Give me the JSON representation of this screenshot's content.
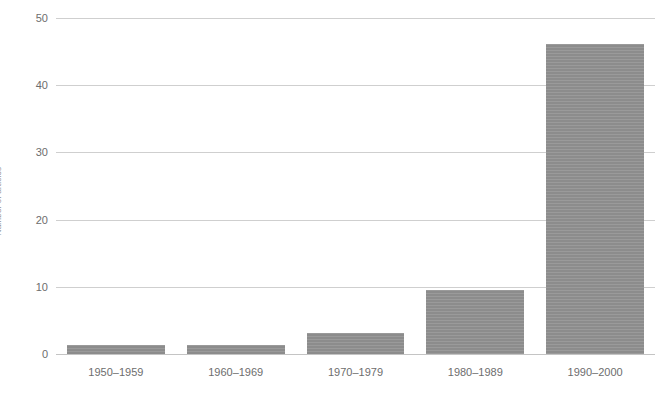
{
  "chart_data": {
    "type": "bar",
    "title": "",
    "subtitle": "",
    "xlabel": "",
    "ylabel": "Number of articles",
    "categories": [
      "1950–1959",
      "1960–1969",
      "1970–1979",
      "1980–1989",
      "1990–2000"
    ],
    "values": [
      1.4,
      1.3,
      3.2,
      9.6,
      46.2
    ],
    "series": [
      {
        "name": "",
        "values": [
          1.4,
          1.3,
          3.2,
          9.6,
          46.2
        ]
      }
    ],
    "ylim": [
      0,
      50
    ],
    "ytick_labels": [
      "0",
      "10",
      "20",
      "30",
      "40",
      "50"
    ],
    "ytick_values": [
      0,
      10,
      20,
      30,
      40,
      50
    ],
    "grid": true,
    "grid_axis": "y",
    "legend": false,
    "legend_position": "none",
    "bar_color": "#919191",
    "grid_color": "#cfcfcf",
    "axis_text_color": "#6d6d6d"
  }
}
